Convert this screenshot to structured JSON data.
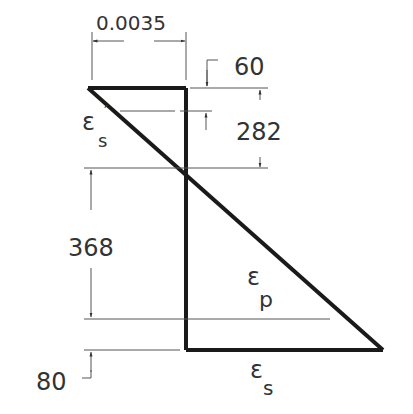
{
  "diagram": {
    "dimensions": {
      "top_strain": "0.0035",
      "top_offset": "60",
      "upper_depth": "282",
      "lower_depth": "368",
      "bottom_offset": "80"
    },
    "labels": {
      "eps_s_prime_symbol": "ε",
      "eps_s_prime_sub": "s",
      "eps_s_prime_mark": "′",
      "eps_p_symbol": "ε",
      "eps_p_sub": "p",
      "eps_s_symbol": "ε",
      "eps_s_sub": "s"
    },
    "colors": {
      "line": "#1a1a1a",
      "dim": "#555555",
      "text": "#333333"
    }
  }
}
